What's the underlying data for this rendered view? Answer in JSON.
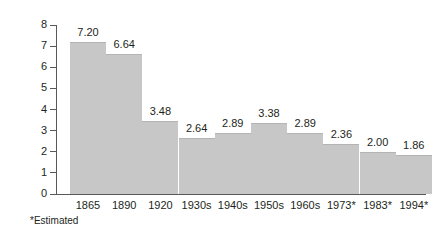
{
  "chart_data": {
    "type": "bar",
    "title": "",
    "subtitle": "",
    "xlabel": "",
    "ylabel": "",
    "categories": [
      "1865",
      "1890",
      "1920",
      "1930s",
      "1940s",
      "1950s",
      "1960s",
      "1973*",
      "1983*",
      "1994*"
    ],
    "values": [
      7.2,
      6.64,
      3.48,
      2.64,
      2.89,
      3.38,
      2.89,
      2.36,
      2.0,
      1.86
    ],
    "value_labels": [
      "7.20",
      "6.64",
      "3.48",
      "2.64",
      "2.89",
      "3.38",
      "2.89",
      "2.36",
      "2.00",
      "1.86"
    ],
    "ylim": [
      0,
      8
    ],
    "yticks": [
      0,
      1,
      2,
      3,
      4,
      5,
      6,
      7,
      8
    ],
    "ytick_labels": [
      "0",
      "1",
      "2",
      "3",
      "4",
      "5",
      "6",
      "7",
      "8"
    ],
    "grid": false,
    "legend": null,
    "annotations": [
      "*Estimated"
    ],
    "bar_color": "#c7c7c7",
    "axis_color": "#58595b",
    "text_color": "#231f20",
    "background_color": "#ffffff"
  },
  "footnote": {
    "text": "*Estimated"
  }
}
